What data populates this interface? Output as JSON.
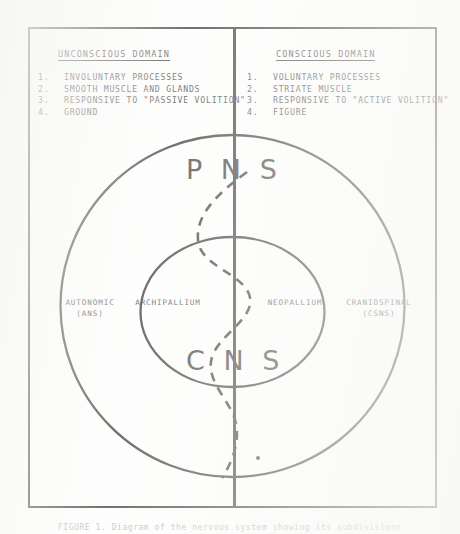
{
  "figure": {
    "title_left": "UNCONSCIOUS DOMAIN",
    "title_right": "CONSCIOUS DOMAIN",
    "left_list": [
      {
        "num": "1.",
        "text": "INVOLUNTARY PROCESSES"
      },
      {
        "num": "2.",
        "text": "SMOOTH MUSCLE AND GLANDS"
      },
      {
        "num": "3.",
        "text": "RESPONSIVE TO \"PASSIVE VOLITION\""
      },
      {
        "num": "4.",
        "text": "GROUND"
      }
    ],
    "right_list": [
      {
        "num": "1.",
        "text": "VOLUNTARY PROCESSES"
      },
      {
        "num": "2.",
        "text": "STRIATE MUSCLE"
      },
      {
        "num": "3.",
        "text": "RESPONSIVE TO \"ACTIVE VOLITION\""
      },
      {
        "num": "4.",
        "text": "FIGURE"
      }
    ],
    "outer_ring_label": "P N S",
    "inner_ring_label": "C N S",
    "quadrant_labels": {
      "outer_left_line1": "AUTONOMIC",
      "outer_left_line2": "(ANS)",
      "inner_left": "ARCHIPALLIUM",
      "inner_right": "NEOPALLIUM",
      "outer_right_line1": "CRANIOSPINAL",
      "outer_right_line2": "(CSNS)"
    },
    "caption": "FIGURE 1.  Diagram of the nervous system showing its subdivisions",
    "ink_color": "#15110f",
    "paper_color": "#fdfdfc"
  }
}
